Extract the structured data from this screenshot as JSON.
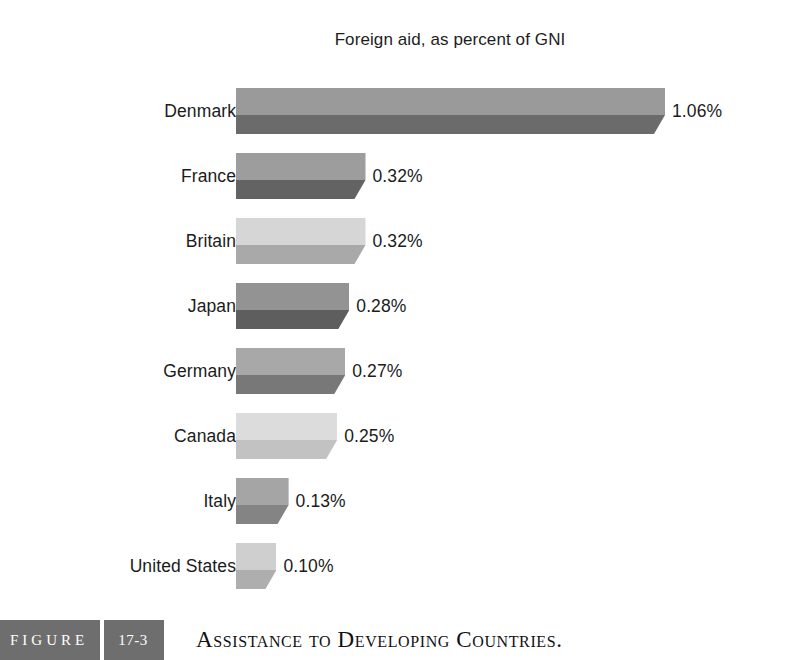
{
  "chart_data": {
    "type": "bar",
    "orientation": "horizontal",
    "title": "Foreign aid, as percent of GNI",
    "xlabel": "",
    "ylabel": "",
    "xlim": [
      0,
      1.06
    ],
    "grid": false,
    "legend": null,
    "value_suffix": "%",
    "categories": [
      "Denmark",
      "France",
      "Britain",
      "Japan",
      "Germany",
      "Canada",
      "Italy",
      "United States"
    ],
    "values": [
      1.06,
      0.32,
      0.32,
      0.28,
      0.27,
      0.25,
      0.13,
      0.1
    ],
    "value_labels": [
      "1.06%",
      "0.32%",
      "0.32%",
      "0.28%",
      "0.27%",
      "0.25%",
      "0.13%",
      "0.10%"
    ],
    "bars": [
      {
        "category": "Denmark",
        "value": 1.06,
        "label": "1.06%",
        "top_color": "#9a9a9a",
        "bottom_color": "#6b6b6b"
      },
      {
        "category": "France",
        "value": 0.32,
        "label": "0.32%",
        "top_color": "#9d9d9d",
        "bottom_color": "#636363"
      },
      {
        "category": "Britain",
        "value": 0.32,
        "label": "0.32%",
        "top_color": "#d6d6d6",
        "bottom_color": "#a9a9a9"
      },
      {
        "category": "Japan",
        "value": 0.28,
        "label": "0.28%",
        "top_color": "#939393",
        "bottom_color": "#5e5e5e"
      },
      {
        "category": "Germany",
        "value": 0.27,
        "label": "0.27%",
        "top_color": "#a8a8a8",
        "bottom_color": "#787878"
      },
      {
        "category": "Canada",
        "value": 0.25,
        "label": "0.25%",
        "top_color": "#dcdcdc",
        "bottom_color": "#c2c2c2"
      },
      {
        "category": "Italy",
        "value": 0.13,
        "label": "0.13%",
        "top_color": "#a5a5a5",
        "bottom_color": "#848484"
      },
      {
        "category": "United States",
        "value": 0.1,
        "label": "0.10%",
        "top_color": "#cfcfcf",
        "bottom_color": "#aeaeae"
      }
    ]
  },
  "figure": {
    "tag_word": "FIGURE",
    "number": "17-3",
    "caption": "Assistance to Developing Countries.",
    "tag_background": "#6e6e6e",
    "tag_text_color": "#ffffff"
  },
  "page": {
    "background": "#ffffff",
    "text_color": "#1b1b1b"
  }
}
